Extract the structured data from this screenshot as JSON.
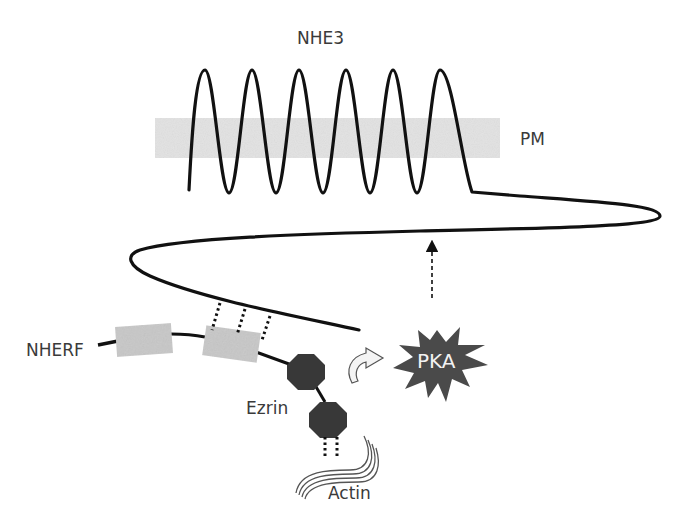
{
  "figure": {
    "type": "schematic",
    "labels": {
      "transporter": "NHE3",
      "membrane": "PM",
      "scaffold": "NHERF",
      "linker": "Ezrin",
      "cytoskeleton": "Actin",
      "kinase": "PKA"
    },
    "components": [
      {
        "name": "NHE3",
        "description": "Six transmembrane loops crossing plasma membrane, long C-terminal tail looping back"
      },
      {
        "name": "PM",
        "description": "Grey shaded plasma membrane band"
      },
      {
        "name": "NHERF",
        "description": "Scaffold with two grey PDZ domain boxes; second box binds NHE3 tail via dotted lines"
      },
      {
        "name": "Ezrin",
        "description": "Two dark octagons linked to NHERF and to actin via dotted lines"
      },
      {
        "name": "Actin",
        "description": "Wavy filament bundle"
      },
      {
        "name": "PKA",
        "description": "Dark star-shaped kinase; curved arrow toward it from ezrin; dashed arrow up to NHE3 tail"
      }
    ],
    "colors": {
      "line": "#111111",
      "membrane": "#d4d4d4",
      "pdz_box": "#c8c8c8",
      "ezrin": "#3a3a3a",
      "pka": "#4a4a4a",
      "pka_text": "#f2f2f2",
      "label_text": "#3a3a3a"
    }
  }
}
